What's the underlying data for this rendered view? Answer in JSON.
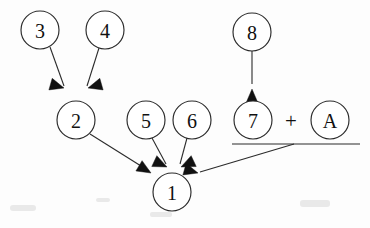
{
  "diagram": {
    "type": "node-arrow-dependency-diagram",
    "background_color": "#fdfdfd",
    "stroke_color": "#2b2b2b",
    "nodes": [
      {
        "id": "n3",
        "label": "3",
        "cx": 40,
        "cy": 30,
        "r": 19
      },
      {
        "id": "n4",
        "label": "4",
        "cx": 105,
        "cy": 30,
        "r": 19
      },
      {
        "id": "n8",
        "label": "8",
        "cx": 252,
        "cy": 32,
        "r": 19
      },
      {
        "id": "n2",
        "label": "2",
        "cx": 76,
        "cy": 120,
        "r": 19
      },
      {
        "id": "n5",
        "label": "5",
        "cx": 146,
        "cy": 120,
        "r": 19
      },
      {
        "id": "n6",
        "label": "6",
        "cx": 192,
        "cy": 120,
        "r": 19
      },
      {
        "id": "n7",
        "label": "7",
        "cx": 253,
        "cy": 120,
        "r": 19
      },
      {
        "id": "nA",
        "label": "A",
        "cx": 330,
        "cy": 120,
        "r": 19
      },
      {
        "id": "n1",
        "label": "1",
        "cx": 172,
        "cy": 192,
        "r": 19
      }
    ],
    "operators": [
      {
        "id": "plus",
        "label": "+",
        "x": 291,
        "y": 120
      }
    ],
    "group_rule": {
      "id": "seven-plus-a-rule",
      "x1": 232,
      "y1": 144,
      "x2": 360,
      "y2": 144
    },
    "edges": [
      {
        "id": "e3-2",
        "from": "3",
        "to": "2",
        "x1": 50,
        "y1": 47,
        "x2": 64,
        "y2": 86
      },
      {
        "id": "e4-2",
        "from": "4",
        "to": "2",
        "x1": 99,
        "y1": 48,
        "x2": 87,
        "y2": 86
      },
      {
        "id": "e8-7",
        "from": "8",
        "to": "7",
        "x1": 252,
        "y1": 51,
        "x2": 252,
        "y2": 84
      },
      {
        "id": "e2-1",
        "from": "2",
        "to": "1",
        "x1": 90,
        "y1": 134,
        "x2": 148,
        "y2": 170
      },
      {
        "id": "e5-1",
        "from": "5",
        "to": "1",
        "x1": 152,
        "y1": 138,
        "x2": 166,
        "y2": 163
      },
      {
        "id": "e6-1",
        "from": "6",
        "to": "1",
        "x1": 187,
        "y1": 138,
        "x2": 179,
        "y2": 163
      },
      {
        "id": "e7a-1",
        "from": "7 + A",
        "to": "1",
        "x1": 294,
        "y1": 144,
        "x2": 200,
        "y2": 172
      }
    ],
    "arrowheads": [
      {
        "id": "ah-3-2",
        "x": 64,
        "y": 88,
        "angle": 196
      },
      {
        "id": "ah-4-2",
        "x": 88,
        "y": 88,
        "angle": -16
      },
      {
        "id": "ah-8-7",
        "x": 252,
        "y": 88,
        "angle": 90
      },
      {
        "id": "ah-2-1",
        "x": 151,
        "y": 172,
        "angle": 31
      },
      {
        "id": "ah-5-1",
        "x": 167,
        "y": 166,
        "angle": 205
      },
      {
        "id": "ah-6-1",
        "x": 181,
        "y": 166,
        "angle": -25
      },
      {
        "id": "ah-7a-1",
        "x": 198,
        "y": 173,
        "angle": 196
      }
    ]
  }
}
